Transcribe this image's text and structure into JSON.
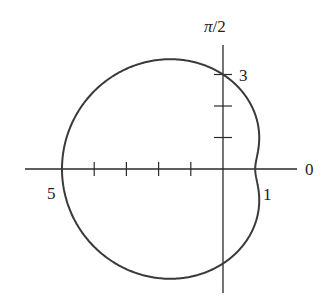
{
  "chart_data": {
    "type": "line",
    "subtype": "polar",
    "equation": "r = 3 - 2cos(theta)",
    "title": "",
    "axis_labels": {
      "polar_axis": "0",
      "vertical_axis": "π/2"
    },
    "tick_labels": [
      {
        "value": 1,
        "position": "positive x (theta=0)",
        "label": "1"
      },
      {
        "value": 3,
        "position": "positive y (theta=π/2)",
        "label": "3"
      },
      {
        "value": 5,
        "position": "negative x (theta=π)",
        "label": "5"
      }
    ],
    "x_ticks_negative": [
      -1,
      -2,
      -3,
      -4
    ],
    "y_ticks_positive": [
      1,
      2,
      3
    ],
    "key_points": [
      {
        "theta": "0",
        "r": 1
      },
      {
        "theta": "π/2",
        "r": 3
      },
      {
        "theta": "π",
        "r": 5
      },
      {
        "theta": "3π/2",
        "r": 3
      }
    ],
    "xlim": [
      -6.2,
      2.3
    ],
    "ylim": [
      -3.9,
      3.9
    ],
    "grid": false,
    "legend": null
  },
  "labels": {
    "zero": "0",
    "pi_half_num": "π",
    "pi_half_rest": "/2",
    "one": "1",
    "three": "3",
    "five": "5"
  },
  "style": {
    "curve_color": "#3a3a3a",
    "axis_color": "#2a2a2a"
  }
}
